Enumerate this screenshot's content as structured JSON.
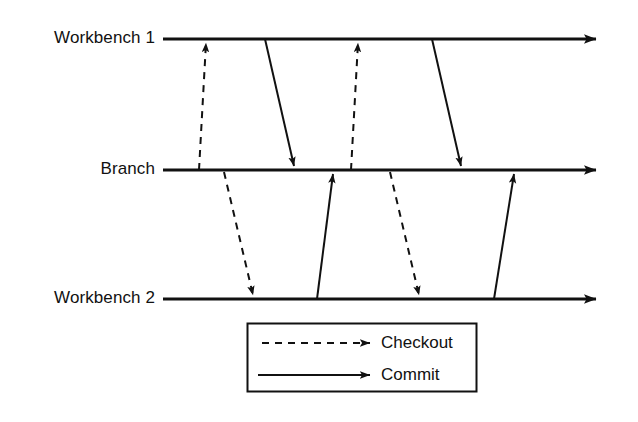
{
  "diagram": {
    "type": "timeline-sequence",
    "colors": {
      "stroke": "#111111",
      "background": "#ffffff"
    },
    "lifelines": [
      {
        "id": "workbench-1",
        "label": "Workbench 1",
        "y": 39,
        "x_start": 163,
        "x_end": 604
      },
      {
        "id": "branch",
        "label": "Branch",
        "y": 170,
        "x_start": 163,
        "x_end": 604
      },
      {
        "id": "workbench-2",
        "label": "Workbench 2",
        "y": 299,
        "x_start": 163,
        "x_end": 604
      }
    ],
    "arrows": [
      {
        "id": "checkout-1",
        "kind": "Checkout",
        "style": "dashed",
        "from": "branch",
        "to": "workbench-1",
        "x1": 199,
        "y1": 170,
        "x2": 206,
        "y2": 42
      },
      {
        "id": "commit-1",
        "kind": "Commit",
        "style": "solid",
        "from": "workbench-1",
        "to": "branch",
        "x1": 265,
        "y1": 39,
        "x2": 294,
        "y2": 167
      },
      {
        "id": "checkout-2",
        "kind": "Checkout",
        "style": "dashed",
        "from": "branch",
        "to": "workbench-2",
        "x1": 224,
        "y1": 172,
        "x2": 253,
        "y2": 296
      },
      {
        "id": "commit-2",
        "kind": "Commit",
        "style": "solid",
        "from": "workbench-2",
        "to": "branch",
        "x1": 317,
        "y1": 299,
        "x2": 333,
        "y2": 173
      },
      {
        "id": "checkout-3",
        "kind": "Checkout",
        "style": "dashed",
        "from": "branch",
        "to": "workbench-1",
        "x1": 351,
        "y1": 170,
        "x2": 358,
        "y2": 42
      },
      {
        "id": "commit-3",
        "kind": "Commit",
        "style": "solid",
        "from": "workbench-1",
        "to": "branch",
        "x1": 432,
        "y1": 39,
        "x2": 461,
        "y2": 167
      },
      {
        "id": "checkout-4",
        "kind": "Checkout",
        "style": "dashed",
        "from": "branch",
        "to": "workbench-2",
        "x1": 390,
        "y1": 172,
        "x2": 419,
        "y2": 296
      },
      {
        "id": "commit-4",
        "kind": "Commit",
        "style": "solid",
        "from": "workbench-2",
        "to": "branch",
        "x1": 494,
        "y1": 299,
        "x2": 514,
        "y2": 173
      }
    ],
    "legend": {
      "box": {
        "x": 247,
        "y": 323,
        "width": 230,
        "height": 69
      },
      "entries": [
        {
          "id": "checkout",
          "label": "Checkout",
          "style": "dashed"
        },
        {
          "id": "commit",
          "label": "Commit",
          "style": "solid"
        }
      ]
    }
  }
}
